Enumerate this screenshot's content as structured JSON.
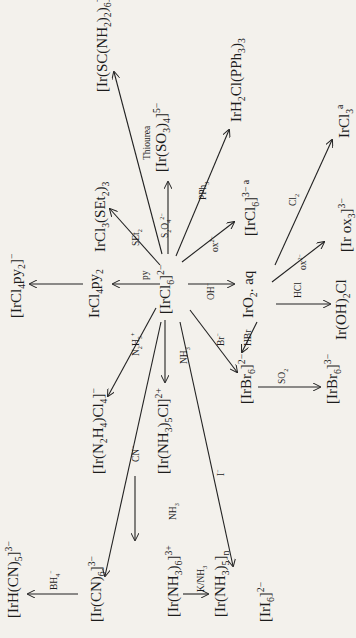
{
  "diagram": {
    "orientation": "rotated 90 degrees counter-clockwise",
    "center_species": "[IrCl6]2-",
    "species": [
      {
        "id": "center",
        "html": "[IrCl<sub>6</sub>]<sup>2−</sup>"
      },
      {
        "id": "thiourea_prod",
        "html": "[Ir(SC(NH<sub>2</sub>)<sub>2</sub>)<sub>6</sub>]<sup>3+</sup>"
      },
      {
        "id": "sulfite_prod",
        "html": "[Ir(SO<sub>3</sub>)<sub>4</sub>]<sup>5−</sup>"
      },
      {
        "id": "pph3_prod",
        "html": "IrH<sub>2</sub>Cl(PPh<sub>3</sub>)<sub>3</sub>"
      },
      {
        "id": "ircl3",
        "html": "IrCl<sub>3</sub><sup>a</sup>"
      },
      {
        "id": "ircl6_3",
        "html": "[IrCl<sub>6</sub>]<sup>3− a</sup>"
      },
      {
        "id": "irox3",
        "html": "[Ir ox<sub>3</sub>]<sup>3−</sup>"
      },
      {
        "id": "iro2",
        "html": "IrO<sub>2</sub>. aq"
      },
      {
        "id": "iroh2cl",
        "html": "Ir(OH)<sub>2</sub>Cl"
      },
      {
        "id": "irbr6_2",
        "html": "[IrBr<sub>6</sub>]<sup>2−</sup>"
      },
      {
        "id": "irbr6_3",
        "html": "[IrBr<sub>6</sub>]<sup>3−</sup>"
      },
      {
        "id": "iri6",
        "html": "[IrI<sub>6</sub>]<sup>2−</sup>"
      },
      {
        "id": "nh3cl",
        "html": "[Ir(NH<sub>3</sub>)<sub>5</sub>Cl]<sup>2+</sup>"
      },
      {
        "id": "nh3_6",
        "html": "[Ir(NH<sub>3</sub>)<sub>6</sub>]<sup>3+</sup>"
      },
      {
        "id": "nh3_5n",
        "html": "[Ir(NH<sub>3</sub>)<sub>5</sub>]<sub>n</sub>"
      },
      {
        "id": "cn6",
        "html": "[Ir(CN)<sub>6</sub>]<sup>3−</sup>"
      },
      {
        "id": "hcn5",
        "html": "[IrH(CN)<sub>5</sub>]<sup>3−</sup>"
      },
      {
        "id": "n2h4",
        "html": "[Ir(N<sub>2</sub>H<sub>4</sub>)Cl<sub>4</sub>]<sup>−</sup>"
      },
      {
        "id": "ircl4py2",
        "html": "IrCl<sub>4</sub>py<sub>2</sub>"
      },
      {
        "id": "ircl4py2_minus",
        "html": "[IrCl<sub>4</sub>py<sub>2</sub>]<sup>−</sup>"
      },
      {
        "id": "ircl3set2",
        "html": "IrCl<sub>3</sub>(SEt<sub>2</sub>)<sub>3</sub>"
      }
    ],
    "reagents": [
      {
        "id": "thiourea",
        "html": "Thiourea"
      },
      {
        "id": "s2o4",
        "html": "S<sub>2</sub>O<sub>4</sub><sup>2−</sup>"
      },
      {
        "id": "pph3",
        "html": "PPh<sub>3</sub>"
      },
      {
        "id": "cl2",
        "html": "Cl<sub>2</sub>"
      },
      {
        "id": "ox1",
        "html": "ox<sup>2−</sup>"
      },
      {
        "id": "ox2",
        "html": "ox<sup>2−</sup>"
      },
      {
        "id": "oh",
        "html": "OH<sup>−</sup>"
      },
      {
        "id": "hcl",
        "html": "HCl"
      },
      {
        "id": "hbr",
        "html": "HBr"
      },
      {
        "id": "br",
        "html": "Br<sup>−</sup>"
      },
      {
        "id": "so2",
        "html": "SO<sub>2</sub>"
      },
      {
        "id": "iodide",
        "html": "I<sup>−</sup>"
      },
      {
        "id": "nh3a",
        "html": "NH<sub>3</sub>"
      },
      {
        "id": "nh3b",
        "html": "NH<sub>3</sub>"
      },
      {
        "id": "knh3",
        "html": "K/NH<sub>3</sub>"
      },
      {
        "id": "cn",
        "html": "CN<sup>−</sup>"
      },
      {
        "id": "bh4",
        "html": "BH<sub>4</sub><sup>−</sup>"
      },
      {
        "id": "n2h5",
        "html": "N<sub>2</sub>H<sub>5</sub><sup>+</sup>"
      },
      {
        "id": "py",
        "html": "py"
      },
      {
        "id": "set2",
        "html": "SEt<sub>2</sub>"
      }
    ]
  }
}
